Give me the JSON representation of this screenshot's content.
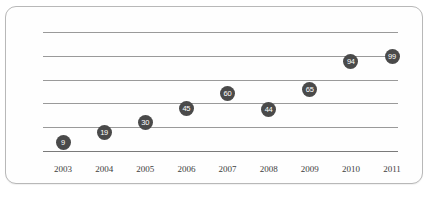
{
  "chart_data": {
    "type": "scatter",
    "title": "",
    "subtitle": "",
    "xlabel": "",
    "ylabel": "",
    "categories": [
      "2003",
      "2004",
      "2005",
      "2006",
      "2007",
      "2008",
      "2009",
      "2010",
      "2011"
    ],
    "values": [
      9,
      19,
      30,
      45,
      60,
      44,
      65,
      94,
      99
    ],
    "series": [
      {
        "name": "",
        "values": [
          9,
          19,
          30,
          45,
          60,
          44,
          65,
          94,
          99
        ]
      }
    ],
    "points": [
      {
        "x": "2003",
        "y": 9,
        "label": "9"
      },
      {
        "x": "2004",
        "y": 19,
        "label": "19"
      },
      {
        "x": "2005",
        "y": 30,
        "label": "30"
      },
      {
        "x": "2006",
        "y": 45,
        "label": "45"
      },
      {
        "x": "2007",
        "y": 60,
        "label": "60"
      },
      {
        "x": "2008",
        "y": 44,
        "label": "44"
      },
      {
        "x": "2009",
        "y": 65,
        "label": "65"
      },
      {
        "x": "2010",
        "y": 94,
        "label": "94"
      },
      {
        "x": "2011",
        "y": 99,
        "label": "99"
      }
    ],
    "ylim": [
      0,
      125
    ],
    "grid": true,
    "gridlines": 5,
    "legend": "none",
    "marker_color": "#4a4a4a",
    "marker_label_color": "#ffffff",
    "gridline_color": "#9a9a9a",
    "axis_color": "#7a7a7a",
    "border_color": "#b8b8b8",
    "background_color": "#fefefe"
  }
}
